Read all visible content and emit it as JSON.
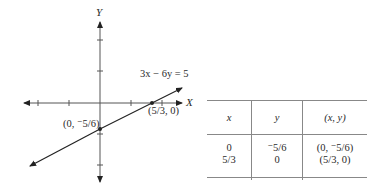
{
  "graph": {
    "y_axis_label": "Y",
    "x_axis_label": "X",
    "equation": {
      "left": "3x − 6y = 5"
    },
    "points": [
      {
        "label": "(0, ⁻5/6)",
        "x": "0",
        "y": "-5/6"
      },
      {
        "label": "(5/3, 0)",
        "x": "5/3",
        "y": "0"
      }
    ]
  },
  "table": {
    "headers": [
      "x",
      "y",
      "(x, y)"
    ],
    "rows": [
      [
        "0",
        "⁻5/6",
        "(0, ⁻5/6)"
      ],
      [
        "5/3",
        "0",
        "(5/3, 0)"
      ]
    ]
  },
  "colors": {
    "ink": "#2a2a2a",
    "rule": "#888888"
  }
}
